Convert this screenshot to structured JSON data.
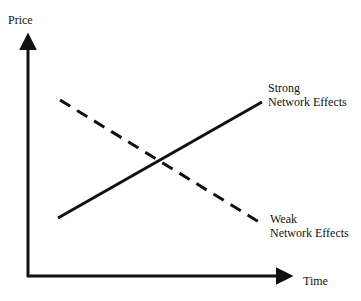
{
  "diagram": {
    "y_axis_label": "Price",
    "x_axis_label": "Time",
    "lines": [
      {
        "name": "Strong Network Effects",
        "label_line1": "Strong",
        "label_line2": "Network Effects",
        "style": "solid",
        "trend": "increasing"
      },
      {
        "name": "Weak Network Effects",
        "label_line1": "Weak",
        "label_line2": "Network Effects",
        "style": "dashed",
        "trend": "decreasing"
      }
    ],
    "colors": {
      "line": "#111111",
      "background": "#ffffff"
    }
  }
}
